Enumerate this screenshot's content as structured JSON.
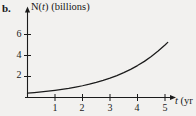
{
  "figure": {
    "part_label": "b.",
    "background_color": "#f2f1ef",
    "ink_color": "#1b1b1b"
  },
  "chart_data": {
    "type": "line",
    "title": "",
    "subtitle": "",
    "xlabel": "t (yr",
    "ylabel": "N(t) (billions)",
    "xlabel_parts": {
      "var": "t",
      "unit": "(yr"
    },
    "ylabel_parts": {
      "func": "N",
      "var": "t",
      "unit": "(billions)"
    },
    "grid": false,
    "legend": "none",
    "xlim": [
      0,
      5.4
    ],
    "ylim": [
      0,
      7.6
    ],
    "xticks": [
      1,
      2,
      3,
      4,
      5
    ],
    "xticklabels": [
      "1",
      "2",
      "3",
      "4",
      "5"
    ],
    "yticks": [
      2,
      4,
      6
    ],
    "yticklabels": [
      "2",
      "4",
      "6"
    ],
    "series": [
      {
        "name": "N(t)",
        "description": "exponential growth curve",
        "x": [
          0,
          0.25,
          0.5,
          0.75,
          1,
          1.25,
          1.5,
          1.75,
          2,
          2.25,
          2.5,
          2.75,
          3,
          3.25,
          3.5,
          3.75,
          4,
          4.25,
          4.5,
          4.75,
          5,
          5.1
        ],
        "y": [
          0.42,
          0.47,
          0.53,
          0.6,
          0.68,
          0.77,
          0.87,
          0.99,
          1.12,
          1.27,
          1.44,
          1.63,
          1.84,
          2.09,
          2.37,
          2.68,
          3.04,
          3.44,
          3.9,
          4.42,
          5.0,
          5.25
        ]
      }
    ]
  }
}
